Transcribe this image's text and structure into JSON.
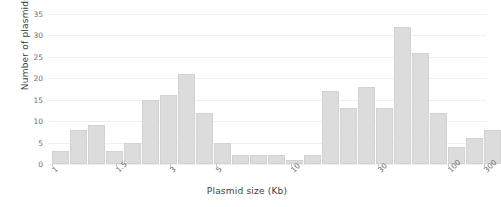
{
  "chart_data": {
    "type": "bar",
    "title": "",
    "xlabel": "Plasmid size (Kb)",
    "ylabel": "Number of plasmids",
    "xscale": "log",
    "xlim": [
      1,
      300
    ],
    "ylim": [
      0,
      35
    ],
    "yticks": [
      0,
      5,
      10,
      15,
      20,
      25,
      30,
      35
    ],
    "xticks": [
      1,
      1.5,
      3,
      5,
      10,
      30,
      100,
      300
    ],
    "xtick_labels": [
      "1",
      "1.5",
      "3",
      "5",
      "10",
      "30",
      "100",
      "300"
    ],
    "grid": true,
    "legend": "none",
    "bar_color": "#dcdcdc",
    "bar_edge_color": "#d2d2d2",
    "categories": [
      "b1",
      "b2",
      "b3",
      "b4",
      "b5",
      "b6",
      "b7",
      "b8",
      "b9",
      "b10",
      "b11",
      "b12",
      "b13",
      "b14",
      "b15",
      "b16",
      "b17",
      "b18",
      "b19",
      "b20",
      "b21",
      "b22"
    ],
    "values": [
      3,
      8,
      9,
      3,
      5,
      15,
      16,
      21,
      12,
      5,
      2,
      2,
      2,
      1,
      2,
      17,
      13,
      18,
      13,
      32,
      26,
      12
    ],
    "values_tail": [
      4,
      6,
      8
    ],
    "bars": [
      {
        "name": "bar-1",
        "value": 3,
        "left": 4.0,
        "width": 17.0
      },
      {
        "name": "bar-2",
        "value": 8,
        "left": 22.0,
        "width": 17.0
      },
      {
        "name": "bar-3",
        "value": 9,
        "left": 40.0,
        "width": 17.0
      },
      {
        "name": "bar-4",
        "value": 3,
        "left": 58.0,
        "width": 17.0
      },
      {
        "name": "bar-5",
        "value": 5,
        "left": 76.0,
        "width": 17.0
      },
      {
        "name": "bar-6",
        "value": 15,
        "left": 94.0,
        "width": 17.0
      },
      {
        "name": "bar-7",
        "value": 16,
        "left": 112.0,
        "width": 17.0
      },
      {
        "name": "bar-8",
        "value": 21,
        "left": 130.0,
        "width": 17.0
      },
      {
        "name": "bar-9",
        "value": 12,
        "left": 148.0,
        "width": 17.0
      },
      {
        "name": "bar-10",
        "value": 5,
        "left": 166.0,
        "width": 17.0
      },
      {
        "name": "bar-11",
        "value": 2,
        "left": 184.0,
        "width": 17.0
      },
      {
        "name": "bar-12",
        "value": 2,
        "left": 202.0,
        "width": 17.0
      },
      {
        "name": "bar-13",
        "value": 2,
        "left": 220.0,
        "width": 17.0
      },
      {
        "name": "bar-14",
        "value": 1,
        "left": 238.0,
        "width": 17.0
      },
      {
        "name": "bar-15",
        "value": 2,
        "left": 256.0,
        "width": 17.0
      },
      {
        "name": "bar-16",
        "value": 17,
        "left": 274.0,
        "width": 17.0
      },
      {
        "name": "bar-17",
        "value": 13,
        "left": 292.0,
        "width": 17.0
      },
      {
        "name": "bar-18",
        "value": 18,
        "left": 310.0,
        "width": 17.0
      },
      {
        "name": "bar-19",
        "value": 13,
        "left": 328.0,
        "width": 17.0
      },
      {
        "name": "bar-20",
        "value": 32,
        "left": 346.0,
        "width": 17.0
      },
      {
        "name": "bar-21",
        "value": 26,
        "left": 364.0,
        "width": 17.0
      },
      {
        "name": "bar-22",
        "value": 12,
        "left": 382.0,
        "width": 17.0
      },
      {
        "name": "bar-23",
        "value": 4,
        "left": 400.0,
        "width": 17.0
      },
      {
        "name": "bar-24",
        "value": 6,
        "left": 418.0,
        "width": 17.0
      },
      {
        "name": "bar-25",
        "value": 8,
        "left": 436.0,
        "width": 17.0
      }
    ],
    "xtick_positions": [
      4.0,
      68.0,
      122.0,
      168.0,
      243.0,
      330.0,
      400.0,
      436.0
    ]
  }
}
